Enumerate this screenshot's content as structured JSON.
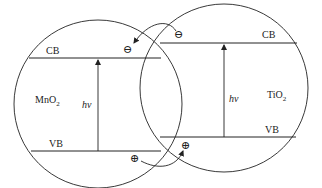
{
  "diagram": {
    "type": "band-alignment heterojunction",
    "left_semiconductor": {
      "name": "MnO",
      "subscript": "2",
      "cb_label": "CB",
      "vb_label": "VB",
      "excitation_label": "hν"
    },
    "right_semiconductor": {
      "name": "TiO",
      "subscript": "2",
      "cb_label": "CB",
      "vb_label": "VB",
      "excitation_label": "hν"
    },
    "charge_carriers": {
      "electron_symbol": "⊖",
      "hole_symbol": "⊕",
      "electron_transfer": "TiO2 CB → MnO2 CB",
      "hole_transfer": "MnO2 VB → TiO2 VB"
    },
    "colors": {
      "line": "#222222",
      "background": "#ffffff"
    }
  }
}
